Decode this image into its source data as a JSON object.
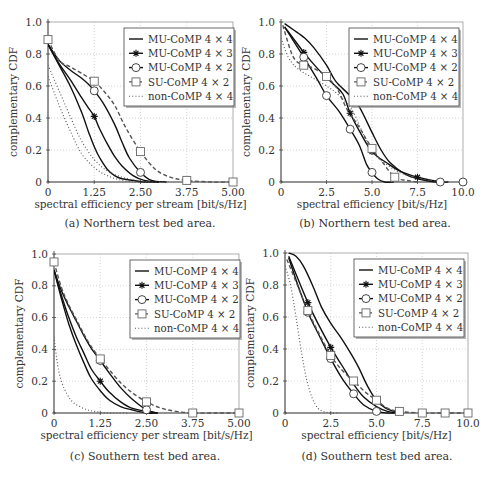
{
  "legend_labels": [
    "MU-CoMP 4 × 4",
    "MU-CoMP 4 × 3",
    "MU-CoMP 4 × 2",
    "SU-CoMP 4 × 2",
    "non-CoMP 4 × 4"
  ],
  "chart_data": [
    {
      "id": "a",
      "type": "line",
      "caption": "(a) Northern test bed area.",
      "xlabel": "spectral efficiency per stream [bit/s/Hz]",
      "ylabel": "complementary CDF",
      "xlim": [
        0,
        5
      ],
      "ylim": [
        0,
        1
      ],
      "xticks": [
        0,
        1.25,
        2.5,
        3.75,
        5.0
      ],
      "xtick_labels": [
        "0",
        "1.25",
        "2.50",
        "3.75",
        "5.00"
      ],
      "yticks": [
        0,
        0.2,
        0.4,
        0.6,
        0.8,
        1.0
      ],
      "ytick_labels": [
        "0",
        "0.2",
        "0.4",
        "0.6",
        "0.8",
        "1.0"
      ],
      "grid": true,
      "legend_position": "upper right",
      "series": [
        {
          "name": "MU-CoMP 4 × 4",
          "style": "solid",
          "marker": "none",
          "x": [
            0,
            0.3,
            0.6,
            0.9,
            1.1,
            1.25,
            1.4,
            1.6,
            1.8,
            2.0,
            2.3,
            2.6,
            3.0
          ],
          "y": [
            0.86,
            0.73,
            0.6,
            0.44,
            0.31,
            0.22,
            0.15,
            0.08,
            0.04,
            0.02,
            0.01,
            0.0,
            0.0
          ]
        },
        {
          "name": "MU-CoMP 4 × 3",
          "style": "solid",
          "marker": "star",
          "x": [
            0,
            0.3,
            0.6,
            0.9,
            1.1,
            1.25,
            1.4,
            1.6,
            1.8,
            2.0,
            2.3,
            2.6,
            3.0
          ],
          "y": [
            0.86,
            0.74,
            0.64,
            0.53,
            0.46,
            0.41,
            0.33,
            0.24,
            0.16,
            0.1,
            0.04,
            0.01,
            0.0
          ],
          "marker_x": [
            1.25
          ],
          "marker_y": [
            0.41
          ]
        },
        {
          "name": "MU-CoMP 4 × 2",
          "style": "solid",
          "marker": "circle",
          "x": [
            0,
            0.3,
            0.6,
            0.9,
            1.1,
            1.25,
            1.5,
            1.8,
            2.0,
            2.2,
            2.5,
            2.8,
            3.2
          ],
          "y": [
            0.86,
            0.76,
            0.7,
            0.65,
            0.61,
            0.57,
            0.49,
            0.36,
            0.25,
            0.15,
            0.06,
            0.01,
            0.0
          ],
          "marker_x": [
            1.25,
            2.5
          ],
          "marker_y": [
            0.57,
            0.06
          ]
        },
        {
          "name": "SU-CoMP 4 × 2",
          "style": "dashed",
          "marker": "square",
          "x": [
            0,
            0.3,
            0.6,
            0.9,
            1.25,
            1.5,
            1.8,
            2.1,
            2.5,
            2.9,
            3.3,
            3.75,
            4.4,
            5.0
          ],
          "y": [
            0.89,
            0.76,
            0.72,
            0.68,
            0.63,
            0.57,
            0.48,
            0.34,
            0.19,
            0.08,
            0.03,
            0.01,
            0.0,
            0.0
          ],
          "marker_x": [
            0,
            1.25,
            2.5,
            3.75,
            5.0
          ],
          "marker_y": [
            0.89,
            0.63,
            0.19,
            0.01,
            0.0
          ]
        },
        {
          "name": "non-CoMP 4 × 4",
          "style": "dotted",
          "marker": "none",
          "x": [
            0,
            0.3,
            0.6,
            0.9,
            1.25,
            1.6,
            2.0,
            2.4,
            2.8,
            3.2
          ],
          "y": [
            0.73,
            0.57,
            0.41,
            0.26,
            0.14,
            0.07,
            0.03,
            0.01,
            0.0,
            0.0
          ]
        },
        {
          "name": "non-CoMP 4 × 4 (lower)",
          "style": "dotted",
          "marker": "none",
          "legend": false,
          "x": [
            0,
            0.3,
            0.6,
            0.9,
            1.25,
            1.6,
            2.0,
            2.4,
            2.8
          ],
          "y": [
            0.66,
            0.48,
            0.32,
            0.18,
            0.09,
            0.04,
            0.01,
            0.0,
            0.0
          ]
        }
      ]
    },
    {
      "id": "b",
      "type": "line",
      "caption": "(b) Northern test bed area.",
      "xlabel": "spectral efficiency [bit/s/Hz]",
      "ylabel": "complementary CDF",
      "xlim": [
        0,
        10
      ],
      "ylim": [
        0,
        1
      ],
      "xticks": [
        0,
        2.5,
        5.0,
        7.5,
        10.0
      ],
      "xtick_labels": [
        "0",
        "2.5",
        "5.0",
        "7.5",
        "10.0"
      ],
      "yticks": [
        0,
        0.2,
        0.4,
        0.6,
        0.8,
        1.0
      ],
      "ytick_labels": [
        "0",
        "0.2",
        "0.4",
        "0.6",
        "0.8",
        "1.0"
      ],
      "grid": true,
      "legend_position": "upper right",
      "series": [
        {
          "name": "MU-CoMP 4 × 4",
          "style": "solid",
          "marker": "none",
          "x": [
            0.2,
            0.7,
            1.3,
            1.8,
            2.5,
            3.0,
            3.7,
            4.3,
            5.0,
            5.5,
            6.0,
            6.8,
            7.5,
            8.5,
            9.2
          ],
          "y": [
            0.99,
            0.95,
            0.9,
            0.84,
            0.73,
            0.63,
            0.55,
            0.47,
            0.31,
            0.2,
            0.12,
            0.05,
            0.02,
            0.0,
            0.0
          ]
        },
        {
          "name": "MU-CoMP 4 × 3",
          "style": "solid",
          "marker": "star",
          "x": [
            0.2,
            1.25,
            2.0,
            2.8,
            3.4,
            3.8,
            4.3,
            5.0,
            5.8,
            6.5,
            7.5,
            8.3,
            9.0
          ],
          "y": [
            0.97,
            0.81,
            0.71,
            0.62,
            0.55,
            0.43,
            0.32,
            0.19,
            0.12,
            0.07,
            0.03,
            0.01,
            0.0
          ],
          "marker_x": [
            1.25,
            3.8,
            5.0,
            7.5
          ],
          "marker_y": [
            0.81,
            0.43,
            0.19,
            0.03
          ]
        },
        {
          "name": "MU-CoMP 4 × 2",
          "style": "solid",
          "marker": "circle",
          "x": [
            0.2,
            1.25,
            2.0,
            2.5,
            3.2,
            3.8,
            4.3,
            4.7,
            5.0,
            5.3,
            5.7,
            6.2
          ],
          "y": [
            0.97,
            0.78,
            0.64,
            0.54,
            0.44,
            0.33,
            0.23,
            0.11,
            0.06,
            0.02,
            0.0,
            0.0
          ],
          "marker_x": [
            1.25,
            2.5,
            3.8,
            5.0,
            8.75,
            10.0
          ],
          "marker_y": [
            0.78,
            0.54,
            0.33,
            0.06,
            0.0,
            0.0
          ]
        },
        {
          "name": "SU-CoMP 4 × 2",
          "style": "dashed",
          "marker": "square",
          "x": [
            0.1,
            0.5,
            0.8,
            1.25,
            1.8,
            2.5,
            3.1,
            3.6,
            4.2,
            5.0,
            5.6,
            6.25,
            6.9,
            7.5
          ],
          "y": [
            0.98,
            0.83,
            0.76,
            0.73,
            0.71,
            0.66,
            0.58,
            0.46,
            0.36,
            0.21,
            0.12,
            0.03,
            0.01,
            0.0
          ],
          "marker_x": [
            1.25,
            2.5,
            5.0,
            6.25
          ],
          "marker_y": [
            0.73,
            0.66,
            0.21,
            0.03
          ]
        },
        {
          "name": "non-CoMP 4 × 4",
          "style": "dotted",
          "marker": "none",
          "x": [
            0.0,
            0.4,
            0.9,
            1.6,
            2.5,
            3.2,
            3.9,
            4.4,
            5.0,
            5.8,
            6.5,
            7.3,
            8.2,
            9.0
          ],
          "y": [
            0.9,
            0.78,
            0.71,
            0.66,
            0.6,
            0.54,
            0.45,
            0.33,
            0.19,
            0.11,
            0.06,
            0.03,
            0.01,
            0.0
          ]
        }
      ]
    },
    {
      "id": "c",
      "type": "line",
      "caption": "(c) Southern test bed area.",
      "xlabel": "spectral efficiency per stream [bit/s/Hz]",
      "ylabel": "complementary CDF",
      "xlim": [
        0,
        5
      ],
      "ylim": [
        0,
        1
      ],
      "xticks": [
        0,
        1.25,
        2.5,
        3.75,
        5.0
      ],
      "xtick_labels": [
        "0",
        "1.25",
        "2.50",
        "3.75",
        "5.00"
      ],
      "yticks": [
        0,
        0.2,
        0.4,
        0.6,
        0.8,
        1.0
      ],
      "ytick_labels": [
        "0",
        "0.2",
        "0.4",
        "0.6",
        "0.8",
        "1.0"
      ],
      "grid": true,
      "legend_position": "upper right",
      "series": [
        {
          "name": "MU-CoMP 4 × 4",
          "style": "solid",
          "marker": "none",
          "x": [
            0,
            0.2,
            0.4,
            0.6,
            0.8,
            1.0,
            1.25,
            1.5,
            1.8,
            2.1,
            2.5,
            2.8
          ],
          "y": [
            0.9,
            0.72,
            0.56,
            0.43,
            0.32,
            0.22,
            0.14,
            0.08,
            0.04,
            0.02,
            0.0,
            0.0
          ]
        },
        {
          "name": "MU-CoMP 4 × 3",
          "style": "solid",
          "marker": "star",
          "x": [
            0,
            0.2,
            0.4,
            0.6,
            0.8,
            1.0,
            1.25,
            1.5,
            1.8,
            2.1,
            2.5,
            2.8
          ],
          "y": [
            0.9,
            0.74,
            0.6,
            0.48,
            0.38,
            0.28,
            0.2,
            0.13,
            0.07,
            0.03,
            0.01,
            0.0
          ],
          "marker_x": [
            1.25
          ],
          "marker_y": [
            0.2
          ]
        },
        {
          "name": "MU-CoMP 4 × 2",
          "style": "solid",
          "marker": "circle",
          "x": [
            0,
            0.2,
            0.4,
            0.6,
            0.8,
            1.0,
            1.25,
            1.5,
            1.8,
            2.1,
            2.5,
            2.8
          ],
          "y": [
            0.9,
            0.77,
            0.67,
            0.58,
            0.49,
            0.41,
            0.33,
            0.25,
            0.16,
            0.09,
            0.02,
            0.0
          ],
          "marker_x": [
            1.25,
            2.5
          ],
          "marker_y": [
            0.33,
            0.02
          ]
        },
        {
          "name": "SU-CoMP 4 × 2",
          "style": "dashed",
          "marker": "square",
          "x": [
            0,
            0.2,
            0.4,
            0.6,
            0.8,
            1.0,
            1.25,
            1.5,
            1.8,
            2.1,
            2.5,
            2.9,
            3.3,
            3.75,
            4.4,
            5.0
          ],
          "y": [
            0.95,
            0.79,
            0.68,
            0.59,
            0.5,
            0.42,
            0.34,
            0.27,
            0.19,
            0.13,
            0.07,
            0.03,
            0.01,
            0.0,
            0.0,
            0.0
          ],
          "marker_x": [
            0,
            1.25,
            2.5,
            3.75,
            5.0
          ],
          "marker_y": [
            0.95,
            0.34,
            0.07,
            0.0,
            0.0
          ]
        },
        {
          "name": "non-CoMP 4 × 4",
          "style": "dotted",
          "marker": "none",
          "x": [
            0,
            0.1,
            0.2,
            0.35,
            0.5,
            0.7,
            0.9,
            1.1,
            1.4,
            1.7,
            2.0
          ],
          "y": [
            0.48,
            0.3,
            0.2,
            0.12,
            0.07,
            0.04,
            0.02,
            0.01,
            0.0,
            0.0,
            0.0
          ]
        }
      ]
    },
    {
      "id": "d",
      "type": "line",
      "caption": "(d) Southern test bed area.",
      "xlabel": "spectral efficiency [bit/s/Hz]",
      "ylabel": "complementary CDF",
      "xlim": [
        0,
        10
      ],
      "ylim": [
        0,
        1
      ],
      "xticks": [
        0,
        2.5,
        5.0,
        7.5,
        10.0
      ],
      "xtick_labels": [
        "0",
        "2.5",
        "5.0",
        "7.5",
        "10.0"
      ],
      "yticks": [
        0,
        0.2,
        0.4,
        0.6,
        0.8,
        1.0
      ],
      "ytick_labels": [
        "0",
        "0.2",
        "0.4",
        "0.6",
        "0.8",
        "1.0"
      ],
      "grid": true,
      "legend_position": "upper right",
      "series": [
        {
          "name": "MU-CoMP 4 × 4",
          "style": "solid",
          "marker": "none",
          "x": [
            0.2,
            0.6,
            1.0,
            1.5,
            2.0,
            2.5,
            3.0,
            3.5,
            4.0,
            4.5,
            5.0,
            5.5,
            6.0,
            6.5
          ],
          "y": [
            1.0,
            0.98,
            0.92,
            0.8,
            0.66,
            0.56,
            0.48,
            0.39,
            0.29,
            0.17,
            0.08,
            0.03,
            0.01,
            0.0
          ]
        },
        {
          "name": "MU-CoMP 4 × 3",
          "style": "solid",
          "marker": "star",
          "x": [
            0.2,
            0.7,
            1.25,
            1.8,
            2.5,
            3.1,
            3.75,
            4.3,
            5.0,
            5.6,
            6.2
          ],
          "y": [
            0.98,
            0.84,
            0.69,
            0.56,
            0.41,
            0.3,
            0.18,
            0.1,
            0.04,
            0.01,
            0.0
          ],
          "marker_x": [
            1.25,
            2.5
          ],
          "marker_y": [
            0.69,
            0.41
          ]
        },
        {
          "name": "MU-CoMP 4 × 2",
          "style": "solid",
          "marker": "circle",
          "x": [
            0.2,
            0.7,
            1.25,
            1.8,
            2.5,
            3.1,
            3.75,
            4.3,
            5.0,
            5.6,
            6.0
          ],
          "y": [
            0.97,
            0.8,
            0.63,
            0.5,
            0.34,
            0.22,
            0.12,
            0.05,
            0.01,
            0.0,
            0.0
          ],
          "marker_x": [
            1.25,
            2.5,
            3.75,
            5.0
          ],
          "marker_y": [
            0.63,
            0.34,
            0.12,
            0.01
          ]
        },
        {
          "name": "SU-CoMP 4 × 2",
          "style": "dashed",
          "marker": "square",
          "x": [
            0.1,
            0.6,
            1.25,
            1.8,
            2.5,
            3.1,
            3.75,
            4.4,
            5.0,
            5.6,
            6.25,
            7.5,
            8.75,
            10.0
          ],
          "y": [
            0.96,
            0.82,
            0.64,
            0.51,
            0.36,
            0.27,
            0.2,
            0.13,
            0.08,
            0.03,
            0.01,
            0.0,
            0.0,
            0.0
          ],
          "marker_x": [
            1.25,
            2.5,
            3.75,
            5.0,
            6.25,
            7.5,
            8.75,
            10.0
          ],
          "marker_y": [
            0.64,
            0.36,
            0.2,
            0.08,
            0.01,
            0.0,
            0.0,
            0.0
          ]
        },
        {
          "name": "non-CoMP 4 × 4",
          "style": "dotted",
          "marker": "none",
          "x": [
            0,
            0.3,
            0.6,
            0.9,
            1.2,
            1.5,
            1.8,
            2.1,
            2.5,
            3.0
          ],
          "y": [
            0.92,
            0.8,
            0.6,
            0.38,
            0.2,
            0.09,
            0.03,
            0.01,
            0.0,
            0.0
          ]
        }
      ]
    }
  ]
}
